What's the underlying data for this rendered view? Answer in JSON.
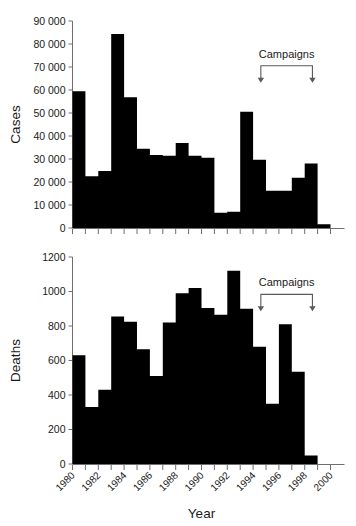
{
  "figure": {
    "background": "#ffffff",
    "bar_color": "#000000",
    "axis_color": "#6e6e6e",
    "annotation_color": "#5a5a5a"
  },
  "xaxis": {
    "title": "Year",
    "tick_labels": [
      "1980",
      "1982",
      "1984",
      "1986",
      "1988",
      "1990",
      "1992",
      "1994",
      "1996",
      "1998",
      "2000"
    ],
    "minor_years": [
      1980,
      1981,
      1982,
      1983,
      1984,
      1985,
      1986,
      1987,
      1988,
      1989,
      1990,
      1991,
      1992,
      1993,
      1994,
      1995,
      1996,
      1997,
      1998,
      1999,
      2000
    ],
    "range": [
      1980,
      2000
    ],
    "label_rotation_deg": -45
  },
  "chart_data": [
    {
      "type": "bar",
      "id": "cases-chart",
      "title": "",
      "xlabel": "Year",
      "ylabel": "Cases",
      "xlim": [
        1980,
        2000
      ],
      "ylim": [
        0,
        90000
      ],
      "grid": false,
      "legend": "none",
      "ytick_labels": [
        "0",
        "10 000",
        "20 000",
        "30 000",
        "40 000",
        "50 000",
        "60 000",
        "70 000",
        "80 000",
        "90 000"
      ],
      "ytick_values": [
        0,
        10000,
        20000,
        30000,
        40000,
        50000,
        60000,
        70000,
        80000,
        90000
      ],
      "categories": [
        1980,
        1981,
        1982,
        1983,
        1984,
        1985,
        1986,
        1987,
        1988,
        1989,
        1990,
        1991,
        1992,
        1993,
        1994,
        1995,
        1996,
        1997,
        1998,
        1999
      ],
      "values": [
        59500,
        22500,
        24800,
        84300,
        56800,
        34500,
        31700,
        31400,
        37000,
        31400,
        30500,
        6600,
        7100,
        50500,
        29700,
        16200,
        16200,
        21800,
        28000,
        1600
      ],
      "annotations": [
        {
          "text": "Campaigns",
          "x_start": 1994.6,
          "x_end": 1998.6,
          "label_x": 1996.6,
          "label_y_value": 74000
        }
      ]
    },
    {
      "type": "bar",
      "id": "deaths-chart",
      "title": "",
      "xlabel": "Year",
      "ylabel": "Deaths",
      "xlim": [
        1980,
        2000
      ],
      "ylim": [
        0,
        1200
      ],
      "grid": false,
      "legend": "none",
      "ytick_labels": [
        "0",
        "200",
        "400",
        "600",
        "800",
        "1000",
        "1200"
      ],
      "ytick_values": [
        0,
        200,
        400,
        600,
        800,
        1000,
        1200
      ],
      "categories": [
        1980,
        1981,
        1982,
        1983,
        1984,
        1985,
        1986,
        1987,
        1988,
        1989,
        1990,
        1991,
        1992,
        1993,
        1994,
        1995,
        1996,
        1997,
        1998,
        1999
      ],
      "values": [
        630,
        330,
        430,
        855,
        825,
        665,
        510,
        820,
        990,
        1020,
        905,
        865,
        1120,
        900,
        680,
        350,
        810,
        535,
        50,
        0
      ],
      "annotations": [
        {
          "text": "Campaigns",
          "x_start": 1994.6,
          "x_end": 1998.6,
          "label_x": 1996.6,
          "label_y_value": 1030
        }
      ]
    }
  ]
}
